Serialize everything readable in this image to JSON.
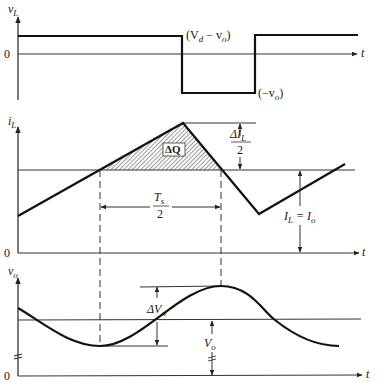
{
  "figure": {
    "type": "buck converter output voltage ripple waveforms",
    "panels": [
      {
        "id": "inductor-voltage",
        "y_label": "v_L",
        "x_label": "t",
        "origin_label": "0",
        "annotations": {
          "high_level": "(V_d − v_o)",
          "low_level": "(−v_o)"
        }
      },
      {
        "id": "inductor-current",
        "y_label": "i_L",
        "x_label": "t",
        "origin_label": "0",
        "annotations": {
          "charge_area": "ΔQ",
          "ripple_half": {
            "num": "ΔI_L",
            "den": "2"
          },
          "avg_current": "I_L = I_o",
          "half_period": {
            "num": "T_s",
            "den": "2"
          }
        }
      },
      {
        "id": "output-voltage",
        "y_label": "v_o",
        "x_label": "t",
        "origin_label": "0",
        "annotations": {
          "ripple": "ΔV_o",
          "avg_voltage": "V_o"
        }
      }
    ]
  },
  "labels": {
    "vL": "v",
    "vL_sub": "L",
    "iL": "i",
    "iL_sub": "L",
    "vo": "v",
    "vo_sub": "o",
    "t": "t",
    "zero": "0",
    "vd_minus_vo_open": "(V",
    "vd_sub": "d",
    "vd_rest": " − v",
    "vo_sub2": "o",
    "close": ")",
    "neg_vo_open": "(−v",
    "neg_vo_sub": "o",
    "dQ": "ΔQ",
    "dIL_num": "ΔI",
    "dIL_sub": "L",
    "two": "2",
    "IL": "I",
    "IL_sub": "L",
    "eq": " = I",
    "Io_sub": "o",
    "Ts": "T",
    "Ts_sub": "s",
    "dVo": "ΔV",
    "dVo_sub": "o",
    "Vo": "V",
    "Vo_sub": "o"
  },
  "colors": {
    "ink": "#111111",
    "background": "#ffffff",
    "hatch": "#555555"
  }
}
